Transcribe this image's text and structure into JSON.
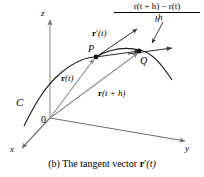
{
  "figure": {
    "caption_prefix": "(b) The tangent vector ",
    "caption_vector_bold": "r",
    "caption_vector_prime": "′",
    "caption_vector_arg": "(t)",
    "colors": {
      "curve": "#1a1a1a",
      "vector": "#8c8c8c",
      "axis": "#808080",
      "text": "#000000",
      "background": "#ffffff"
    }
  },
  "axes": {
    "z_label": "z",
    "y_label": "y",
    "x_label": "x",
    "origin_label": "0"
  },
  "curve": {
    "label": "C"
  },
  "points": {
    "p_label": "P",
    "q_label": "Q"
  },
  "vectors": {
    "position_t": {
      "bold": "r",
      "arg": "(t)"
    },
    "position_t_plus_h": {
      "bold": "r",
      "arg": "(t + h)"
    },
    "tangent": {
      "bold": "r",
      "prime": "′",
      "arg": "(t)"
    }
  },
  "expression": {
    "numerator_bold_1": "r",
    "numerator_arg_1": "(t + h)",
    "numerator_minus": " − ",
    "numerator_bold_2": "r",
    "numerator_arg_2": "(t)",
    "denominator": "h",
    "h_annotation": "h"
  }
}
